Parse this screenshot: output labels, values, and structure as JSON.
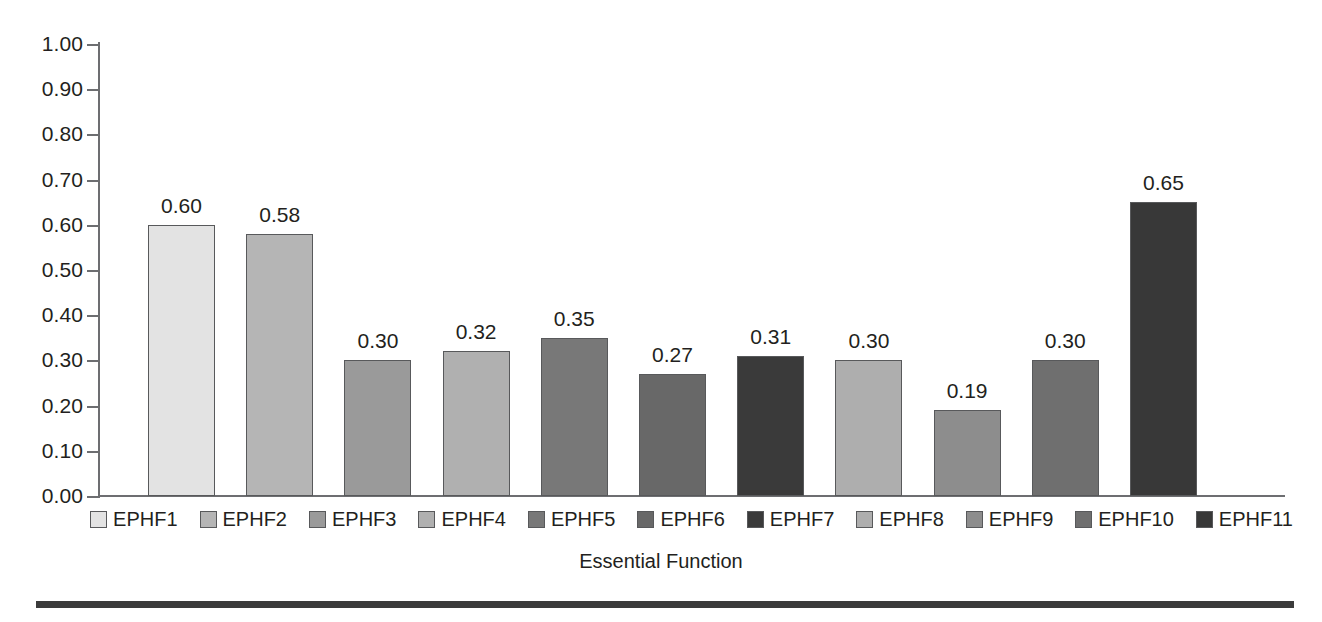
{
  "chart_data": {
    "type": "bar",
    "title": "",
    "xlabel": "Essential Function",
    "ylabel": "",
    "ylim": [
      0.0,
      1.0
    ],
    "ytick_step": 0.1,
    "grid": false,
    "legend_position": "bottom",
    "categories": [
      "EPHF1",
      "EPHF2",
      "EPHF3",
      "EPHF4",
      "EPHF5",
      "EPHF6",
      "EPHF7",
      "EPHF8",
      "EPHF9",
      "EPHF10",
      "EPHF11"
    ],
    "values": [
      0.6,
      0.58,
      0.3,
      0.32,
      0.35,
      0.27,
      0.31,
      0.3,
      0.19,
      0.3,
      0.65
    ],
    "value_labels": [
      "0.60",
      "0.58",
      "0.30",
      "0.32",
      "0.35",
      "0.27",
      "0.31",
      "0.30",
      "0.19",
      "0.30",
      "0.65"
    ],
    "bar_colors": [
      "#e3e3e3",
      "#b5b5b5",
      "#9a9a9a",
      "#b0b0b0",
      "#787878",
      "#686868",
      "#3a3a3a",
      "#aeaeae",
      "#8d8d8d",
      "#6f6f6f",
      "#383838"
    ],
    "bar_border_color": "#58595b",
    "ytick_labels": [
      "1.00",
      "0.90",
      "0.80",
      "0.70",
      "0.60",
      "0.50",
      "0.40",
      "0.30",
      "0.20",
      "0.10",
      "0.00"
    ],
    "ytick_values": [
      1.0,
      0.9,
      0.8,
      0.7,
      0.6,
      0.5,
      0.4,
      0.3,
      0.2,
      0.1,
      0.0
    ],
    "axis_color": "#6d6e71",
    "text_color": "#231f20",
    "background_color": "#ffffff"
  },
  "legend": {
    "items": [
      {
        "label": "EPHF1",
        "color": "#e3e3e3"
      },
      {
        "label": "EPHF2",
        "color": "#b5b5b5"
      },
      {
        "label": "EPHF3",
        "color": "#9a9a9a"
      },
      {
        "label": "EPHF4",
        "color": "#b0b0b0"
      },
      {
        "label": "EPHF5",
        "color": "#787878"
      },
      {
        "label": "EPHF6",
        "color": "#686868"
      },
      {
        "label": "EPHF7",
        "color": "#3a3a3a"
      },
      {
        "label": "EPHF8",
        "color": "#aeaeae"
      },
      {
        "label": "EPHF9",
        "color": "#8d8d8d"
      },
      {
        "label": "EPHF10",
        "color": "#6f6f6f"
      },
      {
        "label": "EPHF11",
        "color": "#383838"
      }
    ]
  },
  "axis_title": {
    "x": "Essential Function"
  },
  "footer": {
    "rule_color": "#3b3b3b"
  }
}
